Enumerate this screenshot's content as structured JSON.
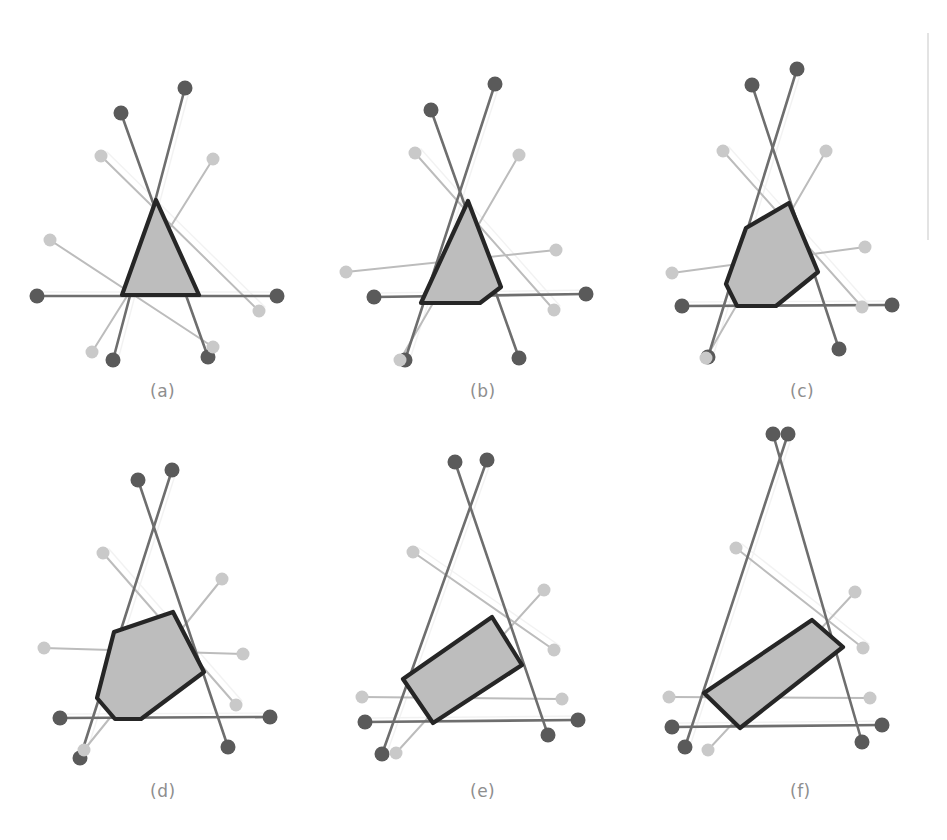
{
  "figure": {
    "kind": "multi-panel-geometry-figure",
    "panel_rows": 2,
    "panel_cols": 3,
    "width": 947,
    "height": 840,
    "background": "#ffffff",
    "scan_artifact": {
      "name": "vertical-scan-line",
      "x": 928,
      "y1": 33,
      "y2": 240,
      "color": "#dcdcdc",
      "width": 1.6
    }
  },
  "style": {
    "dark_dot_color": "#5a5a5a",
    "light_dot_color": "#c9c9c9",
    "dark_line_color": "#6e6e6e",
    "light_line_color": "#bcbcbc",
    "ghost_line_color": "#e4e4e4",
    "polygon_fill": "#bdbdbd",
    "polygon_stroke": "#262626",
    "polygon_stroke_width": 4.2,
    "dark_dot_radius": 7.5,
    "light_dot_radius": 6.5,
    "dark_line_width": 2.6,
    "light_line_width": 2.0,
    "caption_color": "#8e8e8e",
    "caption_font_size": 17
  },
  "captions": [
    {
      "id": "a",
      "label": "(a)",
      "x": 150,
      "y": 381
    },
    {
      "id": "b",
      "label": "(b)",
      "x": 470,
      "y": 381
    },
    {
      "id": "c",
      "label": "(c)",
      "x": 790,
      "y": 381
    },
    {
      "id": "d",
      "label": "(d)",
      "x": 150,
      "y": 781
    },
    {
      "id": "e",
      "label": "(e)",
      "x": 470,
      "y": 781
    },
    {
      "id": "f",
      "label": "(f)",
      "x": 790,
      "y": 781
    }
  ],
  "chart_data": {
    "type": "diagram",
    "title": "",
    "panels": [
      {
        "id": "a",
        "label": "(a)",
        "origin": {
          "x": 0,
          "y": 0
        },
        "center": {
          "x": 160,
          "y": 215
        },
        "segments": [
          {
            "name": "dark-seg-1",
            "tone": "dark",
            "x1": 185,
            "y1": 88,
            "x2": 113,
            "y2": 360
          },
          {
            "name": "dark-seg-2",
            "tone": "dark",
            "x1": 121,
            "y1": 113,
            "x2": 208,
            "y2": 357
          },
          {
            "name": "dark-seg-3",
            "tone": "dark",
            "x1": 37,
            "y1": 296,
            "x2": 277,
            "y2": 296
          },
          {
            "name": "light-seg-1",
            "tone": "light",
            "x1": 50,
            "y1": 240,
            "x2": 213,
            "y2": 347
          },
          {
            "name": "light-seg-2",
            "tone": "light",
            "x1": 101,
            "y1": 156,
            "x2": 259,
            "y2": 311
          },
          {
            "name": "light-seg-3",
            "tone": "light",
            "x1": 213,
            "y1": 159,
            "x2": 92,
            "y2": 352
          }
        ],
        "polygon": [
          {
            "x": 156,
            "y": 200
          },
          {
            "x": 199,
            "y": 295
          },
          {
            "x": 122,
            "y": 295
          }
        ]
      },
      {
        "id": "b",
        "label": "(b)",
        "origin": {
          "x": 320,
          "y": 0
        },
        "center": {
          "x": 160,
          "y": 215
        },
        "segments": [
          {
            "name": "dark-seg-1",
            "tone": "dark",
            "x1": 175,
            "y1": 84,
            "x2": 85,
            "y2": 360
          },
          {
            "name": "dark-seg-2",
            "tone": "dark",
            "x1": 111,
            "y1": 110,
            "x2": 199,
            "y2": 358
          },
          {
            "name": "dark-seg-3",
            "tone": "dark",
            "x1": 54,
            "y1": 297,
            "x2": 266,
            "y2": 294
          },
          {
            "name": "light-seg-1",
            "tone": "light",
            "x1": 26,
            "y1": 272,
            "x2": 236,
            "y2": 250
          },
          {
            "name": "light-seg-2",
            "tone": "light",
            "x1": 95,
            "y1": 153,
            "x2": 234,
            "y2": 310
          },
          {
            "name": "light-seg-3",
            "tone": "light",
            "x1": 199,
            "y1": 155,
            "x2": 80,
            "y2": 360
          }
        ],
        "polygon": [
          {
            "x": 148,
            "y": 201
          },
          {
            "x": 181,
            "y": 287
          },
          {
            "x": 160,
            "y": 303
          },
          {
            "x": 101,
            "y": 303
          }
        ]
      },
      {
        "id": "c",
        "label": "(c)",
        "origin": {
          "x": 630,
          "y": 0
        },
        "center": {
          "x": 160,
          "y": 215
        },
        "segments": [
          {
            "name": "dark-seg-1",
            "tone": "dark",
            "x1": 167,
            "y1": 69,
            "x2": 78,
            "y2": 357
          },
          {
            "name": "dark-seg-2",
            "tone": "dark",
            "x1": 122,
            "y1": 85,
            "x2": 209,
            "y2": 349
          },
          {
            "name": "dark-seg-3",
            "tone": "dark",
            "x1": 52,
            "y1": 306,
            "x2": 262,
            "y2": 305
          },
          {
            "name": "light-seg-1",
            "tone": "light",
            "x1": 42,
            "y1": 273,
            "x2": 235,
            "y2": 247
          },
          {
            "name": "light-seg-2",
            "tone": "light",
            "x1": 93,
            "y1": 151,
            "x2": 232,
            "y2": 307
          },
          {
            "name": "light-seg-3",
            "tone": "light",
            "x1": 196,
            "y1": 151,
            "x2": 76,
            "y2": 358
          }
        ],
        "polygon": [
          {
            "x": 159,
            "y": 203
          },
          {
            "x": 188,
            "y": 272
          },
          {
            "x": 146,
            "y": 306
          },
          {
            "x": 107,
            "y": 306
          },
          {
            "x": 96,
            "y": 284
          },
          {
            "x": 116,
            "y": 228
          }
        ]
      },
      {
        "id": "d",
        "label": "(d)",
        "origin": {
          "x": 0,
          "y": 420
        },
        "center": {
          "x": 160,
          "y": 215
        },
        "segments": [
          {
            "name": "dark-seg-1",
            "tone": "dark",
            "x1": 172,
            "y1": 50,
            "x2": 80,
            "y2": 338
          },
          {
            "name": "dark-seg-2",
            "tone": "dark",
            "x1": 138,
            "y1": 60,
            "x2": 228,
            "y2": 327
          },
          {
            "name": "dark-seg-3",
            "tone": "dark",
            "x1": 60,
            "y1": 298,
            "x2": 270,
            "y2": 297
          },
          {
            "name": "light-seg-1",
            "tone": "light",
            "x1": 44,
            "y1": 228,
            "x2": 243,
            "y2": 234
          },
          {
            "name": "light-seg-2",
            "tone": "light",
            "x1": 103,
            "y1": 133,
            "x2": 236,
            "y2": 285
          },
          {
            "name": "light-seg-3",
            "tone": "light",
            "x1": 222,
            "y1": 159,
            "x2": 84,
            "y2": 330
          }
        ],
        "polygon": [
          {
            "x": 173,
            "y": 192
          },
          {
            "x": 204,
            "y": 252
          },
          {
            "x": 141,
            "y": 299
          },
          {
            "x": 115,
            "y": 299
          },
          {
            "x": 97,
            "y": 278
          },
          {
            "x": 114,
            "y": 212
          }
        ]
      },
      {
        "id": "e",
        "label": "(e)",
        "origin": {
          "x": 320,
          "y": 420
        },
        "center": {
          "x": 160,
          "y": 215
        },
        "segments": [
          {
            "name": "dark-seg-1",
            "tone": "dark",
            "x1": 167,
            "y1": 40,
            "x2": 62,
            "y2": 334
          },
          {
            "name": "dark-seg-2",
            "tone": "dark",
            "x1": 135,
            "y1": 42,
            "x2": 228,
            "y2": 315
          },
          {
            "name": "dark-seg-3",
            "tone": "dark",
            "x1": 45,
            "y1": 302,
            "x2": 258,
            "y2": 300
          },
          {
            "name": "light-seg-1",
            "tone": "light",
            "x1": 42,
            "y1": 277,
            "x2": 242,
            "y2": 279
          },
          {
            "name": "light-seg-2",
            "tone": "light",
            "x1": 93,
            "y1": 132,
            "x2": 234,
            "y2": 230
          },
          {
            "name": "light-seg-3",
            "tone": "light",
            "x1": 224,
            "y1": 170,
            "x2": 76,
            "y2": 333
          }
        ],
        "polygon": [
          {
            "x": 172,
            "y": 197
          },
          {
            "x": 202,
            "y": 245
          },
          {
            "x": 113,
            "y": 303
          },
          {
            "x": 83,
            "y": 259
          }
        ]
      },
      {
        "id": "f",
        "label": "(f)",
        "origin": {
          "x": 630,
          "y": 420
        },
        "center": {
          "x": 160,
          "y": 215
        },
        "segments": [
          {
            "name": "dark-seg-1",
            "tone": "dark",
            "x1": 158,
            "y1": 14,
            "x2": 55,
            "y2": 327
          },
          {
            "name": "dark-seg-2",
            "tone": "dark",
            "x1": 143,
            "y1": 14,
            "x2": 232,
            "y2": 322
          },
          {
            "name": "dark-seg-3",
            "tone": "dark",
            "x1": 42,
            "y1": 307,
            "x2": 252,
            "y2": 305
          },
          {
            "name": "light-seg-1",
            "tone": "light",
            "x1": 39,
            "y1": 277,
            "x2": 240,
            "y2": 278
          },
          {
            "name": "light-seg-2",
            "tone": "light",
            "x1": 106,
            "y1": 128,
            "x2": 233,
            "y2": 228
          },
          {
            "name": "light-seg-3",
            "tone": "light",
            "x1": 225,
            "y1": 172,
            "x2": 78,
            "y2": 330
          }
        ],
        "polygon": [
          {
            "x": 182,
            "y": 200
          },
          {
            "x": 213,
            "y": 227
          },
          {
            "x": 110,
            "y": 308
          },
          {
            "x": 74,
            "y": 273
          }
        ]
      }
    ],
    "dot_sets": {
      "description": "Each line segment terminates in a dot at both ends; dark segments carry dark dots, light segments carry light dots"
    }
  }
}
